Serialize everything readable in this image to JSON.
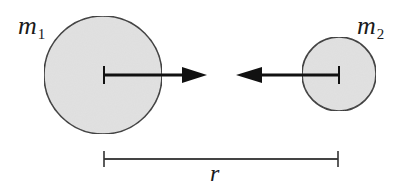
{
  "diagram": {
    "type": "two-body gravitational attraction",
    "colors": {
      "body_fill": "#e2e2e2",
      "body_stroke": "#333333",
      "arrow": "#111111",
      "dimension_line": "#333333",
      "background": "#ffffff"
    },
    "bodies": [
      {
        "id": "m1",
        "label_main": "m",
        "label_sub": "1",
        "center": [
          103,
          75
        ],
        "radius": 59,
        "force_arrow": {
          "from": [
            103,
            75
          ],
          "to": [
            206,
            75
          ],
          "direction": "right"
        }
      },
      {
        "id": "m2",
        "label_main": "m",
        "label_sub": "2",
        "center": [
          339,
          75
        ],
        "radius": 37,
        "force_arrow": {
          "from": [
            339,
            75
          ],
          "to": [
            236,
            75
          ],
          "direction": "left"
        }
      }
    ],
    "separation": {
      "label": "r",
      "from_x": 104,
      "to_x": 338,
      "y": 159
    }
  }
}
